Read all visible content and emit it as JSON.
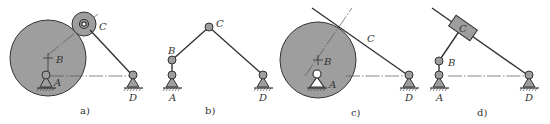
{
  "figure": {
    "panels": [
      {
        "id": "a",
        "caption": "a)",
        "labels": {
          "A": "A",
          "B": "B",
          "C": "C",
          "D": "D"
        }
      },
      {
        "id": "b",
        "caption": "b)",
        "labels": {
          "A": "A",
          "B": "B",
          "C": "C",
          "D": "D"
        }
      },
      {
        "id": "c",
        "caption": "c)",
        "labels": {
          "A": "A",
          "B": "B",
          "C": "C",
          "D": "D"
        }
      },
      {
        "id": "d",
        "caption": "d)",
        "labels": {
          "A": "A",
          "B": "B",
          "C": "C",
          "D": "D"
        }
      }
    ]
  },
  "colors": {
    "fill_gray": "#9e9e9e",
    "stroke": "#333333",
    "background": "#ffffff"
  }
}
